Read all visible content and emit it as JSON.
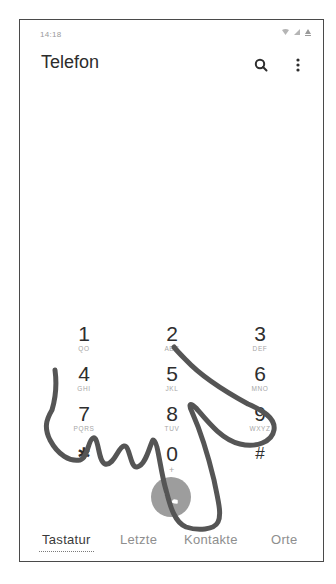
{
  "status_bar": {
    "time": "14:18",
    "icons": [
      "wifi-icon",
      "signal-icon",
      "battery-icon"
    ]
  },
  "header": {
    "title": "Telefon",
    "actions": [
      {
        "name": "search-icon",
        "glyph": "search"
      },
      {
        "name": "more-options-icon",
        "glyph": "⋮"
      }
    ]
  },
  "keypad": {
    "keys": [
      {
        "digit": "1",
        "letters": "QO"
      },
      {
        "digit": "2",
        "letters": "ABC"
      },
      {
        "digit": "3",
        "letters": "DEF"
      },
      {
        "digit": "4",
        "letters": "GHI"
      },
      {
        "digit": "5",
        "letters": "JKL"
      },
      {
        "digit": "6",
        "letters": "MNO"
      },
      {
        "digit": "7",
        "letters": "PQRS"
      },
      {
        "digit": "8",
        "letters": "TUV"
      },
      {
        "digit": "9",
        "letters": "WXYZ"
      },
      {
        "digit": "✱",
        "letters": ""
      },
      {
        "digit": "0",
        "letters": "+"
      },
      {
        "digit": "#",
        "letters": ""
      }
    ]
  },
  "call_button": {
    "icon": "phone-icon",
    "color": "#9d9d9d"
  },
  "tabs": [
    {
      "label": "Tastatur",
      "active": true
    },
    {
      "label": "Letzte",
      "active": false
    },
    {
      "label": "Kontakte",
      "active": false
    },
    {
      "label": "Orte",
      "active": false
    }
  ],
  "annotation": {
    "type": "hand-drawn-stroke",
    "color": "#555555"
  }
}
